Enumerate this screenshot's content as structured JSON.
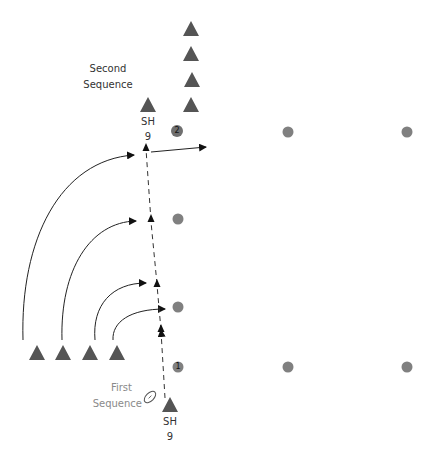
{
  "colors": {
    "player": "#555555",
    "cone": "#808080",
    "line": "#111111",
    "label": "#333333",
    "label_muted": "#8a8a8a"
  },
  "labels": {
    "second_sequence_line1": "Second",
    "second_sequence_line2": "Sequence",
    "first_sequence_line1": "First",
    "first_sequence_line2": "Sequence",
    "sh_top_role": "SH",
    "sh_top_number": "9",
    "sh_bottom_role": "SH",
    "sh_bottom_number": "9",
    "cone_1": "1",
    "cone_2": "2"
  },
  "players": {
    "top_column": [
      {
        "x": 191,
        "y": 29
      },
      {
        "x": 191,
        "y": 54
      },
      {
        "x": 191,
        "y": 80
      },
      {
        "x": 191,
        "y": 105
      }
    ],
    "bottom_row": [
      {
        "x": 37,
        "y": 353
      },
      {
        "x": 63,
        "y": 353
      },
      {
        "x": 90,
        "y": 353
      },
      {
        "x": 117,
        "y": 353
      }
    ],
    "sh_top": {
      "x": 148,
      "y": 105
    },
    "sh_bottom": {
      "x": 170,
      "y": 405
    }
  },
  "cones": [
    {
      "x": 177,
      "y": 131,
      "label": "2"
    },
    {
      "x": 288,
      "y": 132
    },
    {
      "x": 407,
      "y": 132
    },
    {
      "x": 178,
      "y": 219
    },
    {
      "x": 178,
      "y": 307
    },
    {
      "x": 178,
      "y": 367,
      "label": "1"
    },
    {
      "x": 288,
      "y": 367
    },
    {
      "x": 407,
      "y": 367
    }
  ],
  "ball": {
    "x": 150,
    "y": 397,
    "icon": "rugby-ball-icon"
  },
  "runs": {
    "sh_dashed_run": {
      "from": [
        165,
        398
      ],
      "to": [
        146,
        148
      ],
      "arrows": [
        [
          161,
          330
        ],
        [
          157,
          284
        ],
        [
          151,
          221
        ],
        [
          146,
          148
        ]
      ]
    },
    "pass_right": {
      "from": [
        151,
        152
      ],
      "to": [
        206,
        147
      ]
    },
    "curved_passes": [
      {
        "from": [
          23,
          340
        ],
        "to": [
          136,
          155
        ]
      },
      {
        "from": [
          62,
          340
        ],
        "to": [
          138,
          221
        ]
      },
      {
        "from": [
          94,
          340
        ],
        "to": [
          148,
          282
        ]
      },
      {
        "from": [
          113,
          340
        ],
        "to": [
          167,
          309
        ]
      }
    ]
  }
}
